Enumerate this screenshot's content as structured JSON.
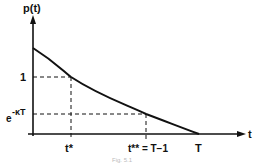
{
  "diagram": {
    "y_axis_label": "p(t)",
    "x_axis_label": "t",
    "y_ticks": [
      {
        "label": "1",
        "y": 77
      },
      {
        "label_base": "e",
        "label_sup": "-κT",
        "y": 114
      }
    ],
    "x_ticks": [
      {
        "label": "t*",
        "x": 71
      },
      {
        "label": "t** = T−1",
        "x": 146
      },
      {
        "label": "T",
        "x": 199
      }
    ],
    "curve": {
      "description": "decreasing convex curve from p(0) above 1 down to 0 at t = T",
      "points": [
        [
          33,
          48
        ],
        [
          71,
          77
        ],
        [
          146,
          114
        ],
        [
          199,
          134
        ]
      ]
    },
    "caption": "Fig. 5.1",
    "colors": {
      "line": "#111111",
      "background": "#ffffff"
    }
  }
}
